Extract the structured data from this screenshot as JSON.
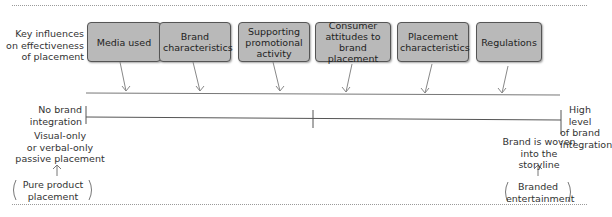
{
  "diagram": {
    "left_heading": [
      "Key influences",
      "on effectiveness",
      "of placement"
    ],
    "influences": [
      {
        "label": "Media used"
      },
      {
        "label": "Brand characteristics"
      },
      {
        "label": "Supporting promotional activity"
      },
      {
        "label": "Consumer attitudes to brand placement"
      },
      {
        "label": "Placement characteristics"
      },
      {
        "label": "Regulations"
      }
    ],
    "scale": {
      "left_label": [
        "No brand",
        "integration"
      ],
      "right_label": [
        "High level",
        "of brand",
        "integration"
      ]
    },
    "left_end": {
      "description": [
        "Visual-only",
        "or verbal-only",
        "passive placement"
      ],
      "type": [
        "Pure product",
        "placement"
      ]
    },
    "right_end": {
      "description": [
        "Brand is woven",
        "into the storyline"
      ],
      "type": [
        "Branded",
        "entertainment"
      ]
    },
    "colors": {
      "box_fill": "#b9b9b9",
      "box_border": "#555555",
      "line": "#555555",
      "arrow": "#888888"
    }
  }
}
